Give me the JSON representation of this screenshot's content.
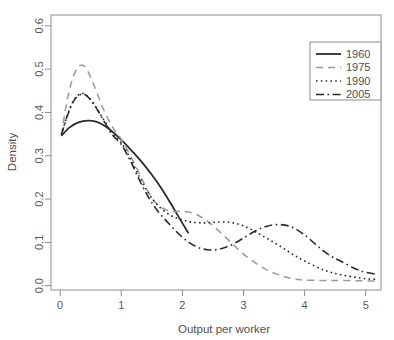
{
  "chart_data": {
    "type": "line",
    "title": "",
    "xlabel": "Output per worker",
    "ylabel": "Density",
    "xlim": [
      -0.15,
      5.25
    ],
    "ylim": [
      -0.01,
      0.625
    ],
    "xticks": [
      "0",
      "1",
      "2",
      "3",
      "4",
      "5"
    ],
    "xtick_values": [
      0,
      1,
      2,
      3,
      4,
      5
    ],
    "yticks": [
      "0.0",
      "0.1",
      "0.2",
      "0.3",
      "0.4",
      "0.5",
      "0.6"
    ],
    "ytick_values": [
      0.0,
      0.1,
      0.2,
      0.3,
      0.4,
      0.5,
      0.6
    ],
    "grid": false,
    "legend_position": "top-right",
    "series": [
      {
        "name": "1960",
        "style": "solid",
        "color": "#2b2b2b",
        "width": 1.8,
        "dash": "",
        "x": [
          0.02,
          0.15,
          0.3,
          0.45,
          0.6,
          0.75,
          0.9,
          1.05,
          1.2,
          1.35,
          1.5,
          1.65,
          1.8,
          1.95,
          2.1
        ],
        "y": [
          0.346,
          0.365,
          0.377,
          0.381,
          0.378,
          0.367,
          0.35,
          0.33,
          0.307,
          0.283,
          0.256,
          0.226,
          0.192,
          0.156,
          0.121
        ]
      },
      {
        "name": "1975",
        "style": "dashed",
        "color": "#9a9a9c",
        "width": 1.5,
        "dash": "7,5",
        "x": [
          0.02,
          0.12,
          0.22,
          0.32,
          0.42,
          0.55,
          0.7,
          0.85,
          1.0,
          1.15,
          1.3,
          1.45,
          1.6,
          1.8,
          2.0,
          2.2,
          2.4,
          2.6,
          2.8,
          3.0,
          3.2,
          3.4,
          3.6,
          3.8,
          4.0,
          4.3,
          4.6,
          5.0,
          5.18
        ],
        "y": [
          0.348,
          0.432,
          0.485,
          0.508,
          0.503,
          0.464,
          0.41,
          0.368,
          0.338,
          0.3,
          0.258,
          0.215,
          0.186,
          0.172,
          0.172,
          0.166,
          0.15,
          0.126,
          0.099,
          0.073,
          0.052,
          0.035,
          0.024,
          0.016,
          0.013,
          0.012,
          0.012,
          0.011,
          0.011
        ]
      },
      {
        "name": "1990",
        "style": "dotted",
        "color": "#2b2b2b",
        "width": 1.6,
        "dash": "1.6,3.2",
        "x": [
          0.02,
          0.12,
          0.22,
          0.32,
          0.42,
          0.55,
          0.7,
          0.85,
          1.0,
          1.15,
          1.3,
          1.45,
          1.6,
          1.8,
          2.0,
          2.2,
          2.4,
          2.6,
          2.8,
          3.0,
          3.2,
          3.4,
          3.6,
          3.8,
          4.0,
          4.3,
          4.6,
          5.0,
          5.18
        ],
        "y": [
          0.348,
          0.395,
          0.428,
          0.442,
          0.441,
          0.42,
          0.386,
          0.352,
          0.33,
          0.293,
          0.25,
          0.213,
          0.185,
          0.163,
          0.152,
          0.146,
          0.145,
          0.147,
          0.146,
          0.138,
          0.124,
          0.108,
          0.091,
          0.073,
          0.057,
          0.037,
          0.025,
          0.016,
          0.015
        ]
      },
      {
        "name": "2005",
        "style": "dashdot",
        "color": "#2b2b2b",
        "width": 1.6,
        "dash": "8,3.5,1.6,3.5",
        "x": [
          0.02,
          0.12,
          0.22,
          0.32,
          0.42,
          0.55,
          0.7,
          0.85,
          1.0,
          1.15,
          1.3,
          1.45,
          1.6,
          1.8,
          2.0,
          2.2,
          2.4,
          2.6,
          2.8,
          3.0,
          3.2,
          3.4,
          3.6,
          3.8,
          4.0,
          4.2,
          4.4,
          4.6,
          4.9,
          5.18
        ],
        "y": [
          0.348,
          0.393,
          0.426,
          0.441,
          0.44,
          0.419,
          0.384,
          0.349,
          0.326,
          0.288,
          0.243,
          0.203,
          0.172,
          0.14,
          0.112,
          0.092,
          0.083,
          0.084,
          0.094,
          0.11,
          0.127,
          0.138,
          0.141,
          0.135,
          0.117,
          0.093,
          0.071,
          0.056,
          0.035,
          0.026
        ]
      }
    ]
  },
  "legend": {
    "entries": [
      {
        "label": "1960"
      },
      {
        "label": "1975"
      },
      {
        "label": "1990"
      },
      {
        "label": "2005"
      }
    ]
  }
}
